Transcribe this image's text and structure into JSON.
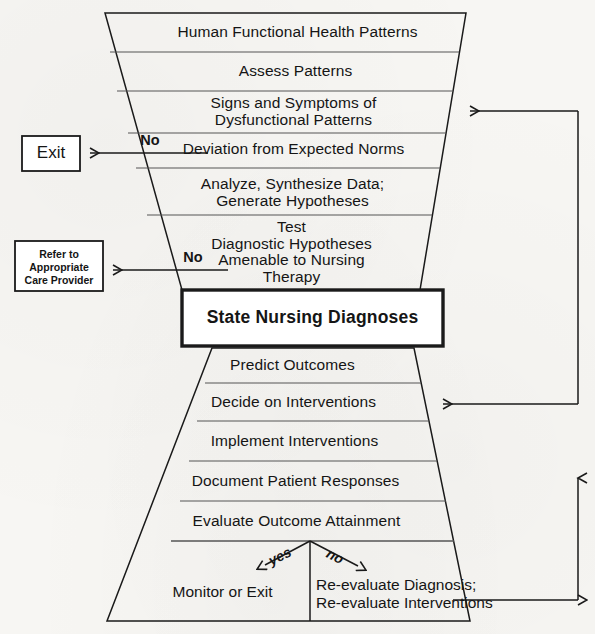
{
  "diagram": {
    "stroke_color": "#1a1a1a",
    "background_color": "#f7f6f3"
  },
  "funnel": {
    "levels": [
      {
        "id": "human-functional-health-patterns",
        "label": "Human Functional Health Patterns"
      },
      {
        "id": "assess-patterns",
        "label": "Assess Patterns"
      },
      {
        "id": "signs-and-symptoms",
        "label": "Signs and Symptoms of\nDysfunctional Patterns"
      },
      {
        "id": "deviation-from-expected-norms",
        "label": "Deviation from Expected Norms"
      },
      {
        "id": "analyze-synthesize-data",
        "label": "Analyze, Synthesize Data;\nGenerate Hypotheses"
      },
      {
        "id": "test-diagnostic-hypotheses",
        "label": "Test\nDiagnostic Hypotheses\nAmenable to Nursing\nTherapy"
      }
    ]
  },
  "diagnosis_box": {
    "label": "State Nursing Diagnoses"
  },
  "pyramid": {
    "levels": [
      {
        "id": "predict-outcomes",
        "label": "Predict Outcomes"
      },
      {
        "id": "decide-on-interventions",
        "label": "Decide on Interventions"
      },
      {
        "id": "implement-interventions",
        "label": "Implement Interventions"
      },
      {
        "id": "document-patient-responses",
        "label": "Document Patient Responses"
      },
      {
        "id": "evaluate-outcome-attainment",
        "label": "Evaluate Outcome Attainment"
      }
    ],
    "outcomes": {
      "yes_label": "yes",
      "no_label": "no",
      "yes_result": "Monitor or Exit",
      "no_result": "Re-evaluate Diagnosis;\nRe-evaluate Interventions"
    }
  },
  "exits": {
    "exit_box": {
      "label": "Exit",
      "branch_label": "No"
    },
    "refer_box": {
      "label": "Refer to\nAppropriate\nCare Provider",
      "branch_label": "No"
    }
  }
}
